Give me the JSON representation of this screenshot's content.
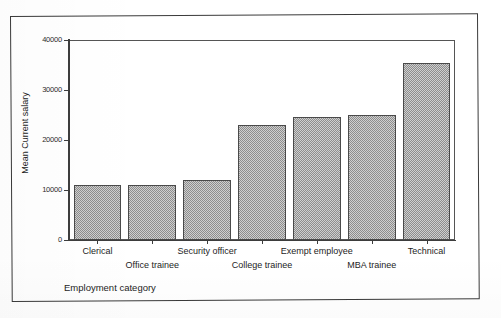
{
  "chart_data": {
    "type": "bar",
    "title": "",
    "xlabel": "Employment category",
    "ylabel": "Mean Current salary",
    "categories": [
      "Clerical",
      "Office trainee",
      "Security officer",
      "College trainee",
      "Exempt employee",
      "MBA trainee",
      "Technical"
    ],
    "values": [
      11000,
      11000,
      12000,
      23000,
      24600,
      25000,
      35400
    ],
    "ylim": [
      0,
      40000
    ],
    "yticks": [
      0,
      10000,
      20000,
      30000,
      40000
    ],
    "ytick_labels": [
      "0",
      "10000",
      "20000",
      "30000",
      "40000"
    ],
    "grid": false,
    "legend": "none",
    "bar_fill_color": "#b3b3b3",
    "bar_border_color": "#4a4a4a",
    "axis_color": "#3d3d3d",
    "background_color": "#ffffff"
  },
  "axes": {
    "y_title": "Mean Current salary",
    "x_title": "Employment category"
  }
}
